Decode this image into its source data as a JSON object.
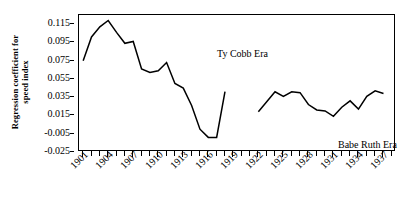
{
  "chart_data": {
    "type": "line",
    "title": "",
    "xlabel": "",
    "ylabel": "Regression coefficient for speed index",
    "ylabel_lines": [
      "Regression coefficient for",
      "speed index"
    ],
    "ylim": [
      -0.025,
      0.125
    ],
    "ytick_values": [
      0.115,
      0.095,
      0.075,
      0.055,
      0.035,
      0.015,
      -0.005,
      -0.025
    ],
    "ytick_labels": [
      "0.115",
      "0.095",
      "0.075",
      "0.055",
      "0.035",
      "0.015",
      "-0.005",
      "-0.025"
    ],
    "xlim": [
      1900.5,
      1938.5
    ],
    "xtick_years": [
      1901,
      1902,
      1903,
      1904,
      1905,
      1906,
      1907,
      1908,
      1909,
      1910,
      1911,
      1912,
      1913,
      1914,
      1915,
      1916,
      1917,
      1918,
      1919,
      1920,
      1921,
      1922,
      1923,
      1924,
      1925,
      1926,
      1927,
      1928,
      1929,
      1930,
      1931,
      1932,
      1933,
      1934,
      1935,
      1936,
      1937,
      1938
    ],
    "xtick_labels": [
      "1901",
      "1904",
      "1907",
      "1910",
      "1913",
      "1916",
      "1919",
      "1922",
      "1925",
      "1928",
      "1931",
      "1934",
      "1937"
    ],
    "xtick_label_years": [
      1901,
      1904,
      1907,
      1910,
      1913,
      1916,
      1919,
      1922,
      1925,
      1928,
      1931,
      1934,
      1937
    ],
    "grid": false,
    "legend": "none",
    "annotations": [
      {
        "text": "Ty Cobb Era",
        "x": 1908.5,
        "y": 0.098
      },
      {
        "text": "Babe Ruth Era",
        "x": 1928.0,
        "y": 0.005
      }
    ],
    "series": [
      {
        "name": "Ty Cobb Era",
        "color": "#000000",
        "x": [
          1901,
          1902,
          1903,
          1904,
          1905,
          1906,
          1907,
          1908,
          1909,
          1910,
          1911,
          1912,
          1913,
          1914,
          1915,
          1916,
          1917,
          1918
        ],
        "values": [
          0.075,
          0.101,
          0.112,
          0.119,
          0.106,
          0.094,
          0.096,
          0.066,
          0.062,
          0.064,
          0.073,
          0.05,
          0.045,
          0.026,
          0.0,
          -0.009,
          -0.009,
          0.041
        ]
      },
      {
        "name": "Babe Ruth Era",
        "color": "#000000",
        "x": [
          1922,
          1923,
          1924,
          1925,
          1926,
          1927,
          1928,
          1929,
          1930,
          1931,
          1932,
          1933,
          1934,
          1935,
          1936,
          1937
        ],
        "values": [
          0.019,
          0.03,
          0.041,
          0.036,
          0.041,
          0.04,
          0.027,
          0.021,
          0.02,
          0.014,
          0.024,
          0.031,
          0.022,
          0.036,
          0.042,
          0.039
        ]
      }
    ]
  }
}
